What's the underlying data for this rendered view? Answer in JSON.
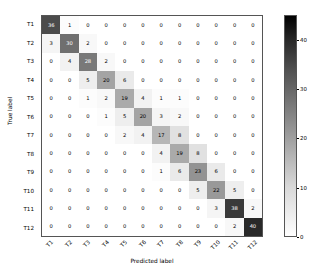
{
  "chart_data": {
    "type": "heatmap",
    "title": "",
    "xlabel": "Predicted label",
    "ylabel": "True label",
    "categories": [
      "T1",
      "T2",
      "T3",
      "T4",
      "T5",
      "T6",
      "T7",
      "T8",
      "T9",
      "T10",
      "T11",
      "T12"
    ],
    "x_tick_labels": [
      "T1",
      "T2",
      "T3",
      "T4",
      "T5",
      "T6",
      "T7",
      "T8",
      "T9",
      "T10",
      "T11",
      "T12"
    ],
    "y_tick_labels": [
      "T1",
      "T2",
      "T3",
      "T4",
      "T5",
      "T6",
      "T7",
      "T8",
      "T9",
      "T10",
      "T11",
      "T12"
    ],
    "colormap": "Greys",
    "colorbar": {
      "min": 0,
      "max": 45,
      "ticks": [
        0,
        10,
        20,
        30,
        40
      ],
      "tick_labels": [
        "0",
        "10",
        "20",
        "30",
        "40"
      ],
      "position": "right"
    },
    "grid": false,
    "values": [
      [
        36,
        1,
        0,
        0,
        0,
        0,
        0,
        0,
        0,
        0,
        0,
        0
      ],
      [
        3,
        30,
        2,
        0,
        0,
        0,
        0,
        0,
        0,
        0,
        0,
        0
      ],
      [
        0,
        4,
        28,
        2,
        0,
        0,
        0,
        0,
        0,
        0,
        0,
        0
      ],
      [
        0,
        0,
        5,
        20,
        6,
        0,
        0,
        0,
        0,
        0,
        0,
        0
      ],
      [
        0,
        0,
        1,
        2,
        19,
        4,
        1,
        1,
        0,
        0,
        0,
        0
      ],
      [
        0,
        0,
        0,
        1,
        5,
        20,
        3,
        2,
        0,
        0,
        0,
        0
      ],
      [
        0,
        0,
        0,
        0,
        2,
        4,
        17,
        8,
        0,
        0,
        0,
        0
      ],
      [
        0,
        0,
        0,
        0,
        0,
        0,
        4,
        19,
        8,
        0,
        0,
        0
      ],
      [
        0,
        0,
        0,
        0,
        0,
        0,
        1,
        6,
        23,
        6,
        0,
        0
      ],
      [
        0,
        0,
        0,
        0,
        0,
        0,
        0,
        0,
        5,
        22,
        5,
        0
      ],
      [
        0,
        0,
        0,
        0,
        0,
        0,
        0,
        0,
        0,
        3,
        38,
        2
      ],
      [
        0,
        0,
        0,
        0,
        0,
        0,
        0,
        0,
        0,
        0,
        2,
        40
      ]
    ]
  }
}
